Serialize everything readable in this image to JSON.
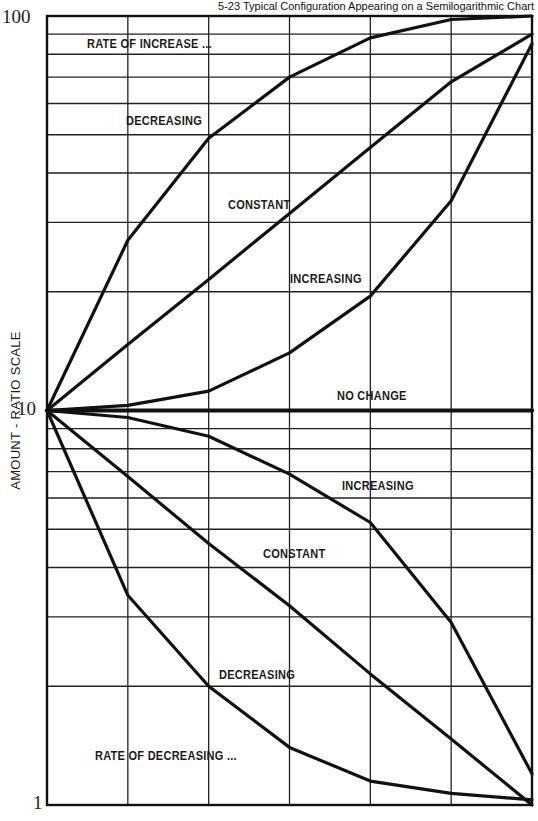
{
  "title": "5-23 Typical Configuration Appearing on a Semilogarithmic Chart",
  "chart_data": {
    "type": "line",
    "title": "5-23 Typical Configuration Appearing on a Semilogarithmic Chart",
    "xlabel": "",
    "ylabel": "AMOUNT - RATIO SCALE",
    "yscale": "log",
    "ylim": [
      1,
      100
    ],
    "ytick_labels": [
      "1",
      "10",
      "100"
    ],
    "x": [
      0,
      1,
      2,
      3,
      4,
      5,
      6
    ],
    "grid": true,
    "legend": "none (inline annotations)",
    "series": [
      {
        "name": "Rate of increase - decreasing",
        "values": [
          10,
          27,
          49,
          70,
          88,
          98,
          100
        ]
      },
      {
        "name": "Rate of increase - constant",
        "values": [
          10,
          14.7,
          21.5,
          31.6,
          46.4,
          68.1,
          90
        ]
      },
      {
        "name": "Rate of increase - increasing",
        "values": [
          10,
          10.3,
          11.2,
          14,
          19.5,
          34,
          85
        ]
      },
      {
        "name": "No change",
        "values": [
          10,
          10,
          10,
          10,
          10,
          10,
          10
        ]
      },
      {
        "name": "Rate of decrease - increasing",
        "values": [
          10,
          9.6,
          8.6,
          6.9,
          5.2,
          2.9,
          1.2
        ]
      },
      {
        "name": "Rate of decrease - constant",
        "values": [
          10,
          6.8,
          4.6,
          3.2,
          2.15,
          1.47,
          1.0
        ]
      },
      {
        "name": "Rate of decrease - decreasing",
        "values": [
          10,
          3.4,
          2.0,
          1.4,
          1.15,
          1.07,
          1.03
        ]
      }
    ],
    "annotations": [
      "RATE OF INCREASE ...",
      "DECREASING",
      "CONSTANT",
      "INCREASING",
      "NO CHANGE",
      "INCREASING",
      "CONSTANT",
      "DECREASING",
      "RATE OF DECREASING ..."
    ]
  },
  "labels": {
    "y100": "100",
    "y10": "10",
    "y1": "1",
    "ylabel": "AMOUNT - RATIO SCALE",
    "rate_increase": "RATE OF INCREASE ...",
    "inc_decreasing": "DECREASING",
    "inc_constant": "CONSTANT",
    "inc_increasing": "INCREASING",
    "no_change": "NO CHANGE",
    "dec_increasing": "INCREASING",
    "dec_constant": "CONSTANT",
    "dec_decreasing": "DECREASING",
    "rate_decrease": "RATE OF DECREASING ..."
  }
}
